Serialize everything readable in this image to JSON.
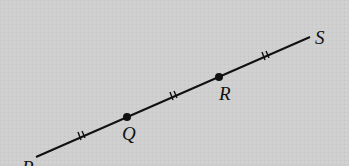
{
  "diagram": {
    "points": [
      {
        "label": "P",
        "x": 36,
        "y": 157
      },
      {
        "label": "Q",
        "x": 127,
        "y": 117
      },
      {
        "label": "R",
        "x": 219,
        "y": 77
      },
      {
        "label": "S",
        "x": 310,
        "y": 37
      }
    ],
    "tick_marks": "double",
    "colors": {
      "background": "#cfcfcf",
      "stroke": "#111111"
    }
  }
}
